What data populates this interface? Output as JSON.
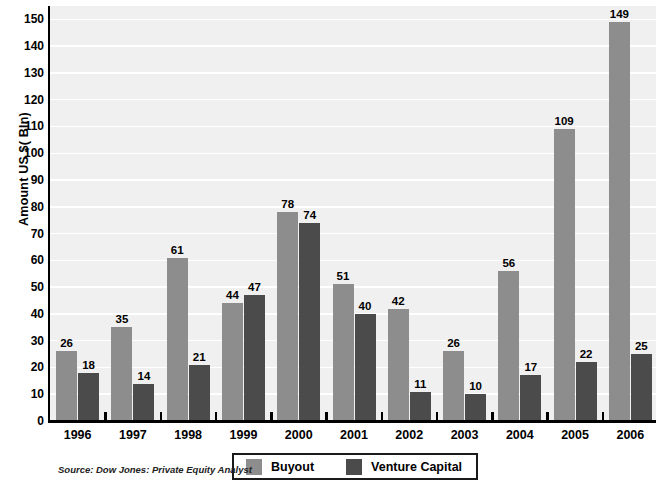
{
  "chart_data": {
    "type": "bar",
    "title": "",
    "xlabel": "",
    "ylabel": "Amount US $( Bln)",
    "ylim": [
      0,
      155
    ],
    "ytick_step": 10,
    "yticks": [
      0,
      10,
      20,
      30,
      40,
      50,
      60,
      70,
      80,
      90,
      100,
      110,
      120,
      130,
      140,
      150
    ],
    "ytick_labels": [
      "0",
      "10",
      "20",
      "30",
      "40",
      "50",
      "60",
      "70",
      "80",
      "90",
      "100",
      "110",
      "120",
      "130",
      "140",
      "150"
    ],
    "grid": true,
    "grid_axis": "y",
    "grid_color": "#ffffff",
    "plot_background": "#f0f0f0",
    "legend_position": "bottom-center",
    "categories": [
      "1996",
      "1997",
      "1998",
      "1999",
      "2000",
      "2001",
      "2002",
      "2003",
      "2004",
      "2005",
      "2006"
    ],
    "series": [
      {
        "name": "Buyout",
        "color": "#8d8d8d",
        "values": [
          26,
          35,
          61,
          44,
          78,
          51,
          42,
          26,
          56,
          109,
          149
        ]
      },
      {
        "name": "Venture Capital",
        "color": "#4b4b4b",
        "values": [
          18,
          14,
          21,
          47,
          74,
          40,
          11,
          10,
          17,
          22,
          25
        ]
      }
    ],
    "data_labels": true,
    "source": "Source: Dow Jones: Private Equity Analyst"
  },
  "legend": {
    "entries": [
      {
        "label": "Buyout",
        "color": "#8d8d8d"
      },
      {
        "label": "Venture Capital",
        "color": "#4b4b4b"
      }
    ]
  },
  "footer": {
    "source": "Source: Dow Jones: Private Equity Analyst"
  }
}
